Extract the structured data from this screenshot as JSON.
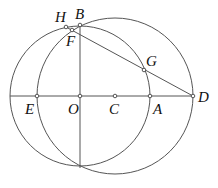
{
  "diagram": {
    "type": "geometry",
    "points": {
      "H": {
        "label": "H",
        "x": 66,
        "y": 27,
        "lx": 55,
        "ly": 22
      },
      "B": {
        "label": "B",
        "x": 80,
        "y": 25,
        "lx": 75,
        "ly": 19
      },
      "F": {
        "label": "F",
        "x": 72,
        "y": 30,
        "lx": 66,
        "ly": 46
      },
      "G": {
        "label": "G",
        "x": 144,
        "y": 70,
        "lx": 146,
        "ly": 66
      },
      "E": {
        "label": "E",
        "x": 37,
        "y": 96,
        "lx": 25,
        "ly": 114
      },
      "O": {
        "label": "O",
        "x": 80,
        "y": 96,
        "lx": 68,
        "ly": 114
      },
      "C": {
        "label": "C",
        "x": 115,
        "y": 96,
        "lx": 109,
        "ly": 114
      },
      "A": {
        "label": "A",
        "x": 150,
        "y": 96,
        "lx": 153,
        "ly": 114
      },
      "D": {
        "label": "D",
        "x": 193,
        "y": 96,
        "lx": 198,
        "ly": 102
      }
    },
    "circles": [
      {
        "name": "circle-O",
        "cx": 80,
        "cy": 96,
        "r": 70
      },
      {
        "name": "circle-C",
        "cx": 115,
        "cy": 96,
        "r": 78
      }
    ],
    "segments": [
      {
        "name": "line-ED",
        "from": "E",
        "to": "D",
        "x1": 10,
        "y1": 96,
        "x2": 193,
        "y2": 96
      },
      {
        "name": "line-BO",
        "x1": 80,
        "y1": 25,
        "x2": 80,
        "y2": 168
      },
      {
        "name": "line-DH",
        "x1": 193,
        "y1": 96,
        "x2": 66,
        "y2": 27
      }
    ]
  }
}
